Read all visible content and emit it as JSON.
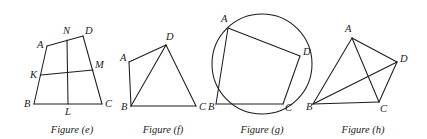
{
  "page": {
    "background_color": "#ffffff",
    "stroke_color": "#1d1d1d",
    "width": 427,
    "height": 139
  },
  "figures": [
    {
      "id": "figure-e",
      "caption": "Figure (e)",
      "caption_x": 72,
      "caption_y": 133,
      "shape": "trapezoid with midsegments",
      "vertices": [
        {
          "name": "A",
          "x": 47,
          "y": 46,
          "label_x": 37,
          "label_y": 48
        },
        {
          "name": "D",
          "x": 83,
          "y": 36,
          "label_x": 85,
          "label_y": 34
        },
        {
          "name": "B",
          "x": 34,
          "y": 104,
          "label_x": 24,
          "label_y": 107
        },
        {
          "name": "C",
          "x": 102,
          "y": 104,
          "label_x": 105,
          "label_y": 107
        },
        {
          "name": "N",
          "x": 67,
          "y": 40,
          "label_x": 63,
          "label_y": 34
        },
        {
          "name": "L",
          "x": 68,
          "y": 104,
          "label_x": 65,
          "label_y": 115
        },
        {
          "name": "K",
          "x": 41,
          "y": 75,
          "label_x": 30,
          "label_y": 78
        },
        {
          "name": "M",
          "x": 93,
          "y": 70,
          "label_x": 95,
          "label_y": 68
        }
      ],
      "segments": [
        {
          "name": "AD",
          "from": "A",
          "to": "D"
        },
        {
          "name": "AB",
          "from": "A",
          "to": "B"
        },
        {
          "name": "BC",
          "from": "B",
          "to": "C"
        },
        {
          "name": "DC",
          "from": "D",
          "to": "C"
        },
        {
          "name": "NL",
          "from": "N",
          "to": "L"
        },
        {
          "name": "KM",
          "from": "K",
          "to": "M"
        }
      ]
    },
    {
      "id": "figure-f",
      "caption": "Figure (f)",
      "caption_x": 163,
      "caption_y": 133,
      "shape": "quadrilateral with one diagonal",
      "vertices": [
        {
          "name": "A",
          "x": 129,
          "y": 62,
          "label_x": 120,
          "label_y": 61
        },
        {
          "name": "D",
          "x": 166,
          "y": 45,
          "label_x": 166,
          "label_y": 40
        },
        {
          "name": "B",
          "x": 131,
          "y": 106,
          "label_x": 121,
          "label_y": 110
        },
        {
          "name": "C",
          "x": 196,
          "y": 106,
          "label_x": 199,
          "label_y": 110
        }
      ],
      "segments": [
        {
          "name": "AD",
          "from": "A",
          "to": "D"
        },
        {
          "name": "AB",
          "from": "A",
          "to": "B"
        },
        {
          "name": "BC",
          "from": "B",
          "to": "C"
        },
        {
          "name": "DC",
          "from": "D",
          "to": "C"
        },
        {
          "name": "BD",
          "from": "B",
          "to": "D"
        }
      ]
    },
    {
      "id": "figure-g",
      "caption": "Figure (g)",
      "caption_x": 262,
      "caption_y": 133,
      "shape": "cyclic quadrilateral inscribed in a circle",
      "circle": {
        "cx": 262,
        "cy": 64,
        "r": 50
      },
      "vertices": [
        {
          "name": "A",
          "x": 228,
          "y": 28,
          "label_x": 221,
          "label_y": 22
        },
        {
          "name": "D",
          "x": 300,
          "y": 56,
          "label_x": 303,
          "label_y": 55
        },
        {
          "name": "B",
          "x": 216,
          "y": 104,
          "label_x": 208,
          "label_y": 110
        },
        {
          "name": "C",
          "x": 283,
          "y": 104,
          "label_x": 285,
          "label_y": 111
        }
      ],
      "segments": [
        {
          "name": "AD",
          "from": "A",
          "to": "D"
        },
        {
          "name": "AB",
          "from": "A",
          "to": "B"
        },
        {
          "name": "BC",
          "from": "B",
          "to": "C"
        },
        {
          "name": "DC",
          "from": "D",
          "to": "C"
        }
      ]
    },
    {
      "id": "figure-h",
      "caption": "Figure (h)",
      "caption_x": 363,
      "caption_y": 133,
      "shape": "quadrilateral with both diagonals",
      "vertices": [
        {
          "name": "A",
          "x": 352,
          "y": 38,
          "label_x": 345,
          "label_y": 32
        },
        {
          "name": "D",
          "x": 397,
          "y": 62,
          "label_x": 400,
          "label_y": 62
        },
        {
          "name": "B",
          "x": 313,
          "y": 104,
          "label_x": 306,
          "label_y": 110
        },
        {
          "name": "C",
          "x": 379,
          "y": 102,
          "label_x": 380,
          "label_y": 112
        }
      ],
      "segments": [
        {
          "name": "AD",
          "from": "A",
          "to": "D"
        },
        {
          "name": "AB",
          "from": "A",
          "to": "B"
        },
        {
          "name": "BC",
          "from": "B",
          "to": "C"
        },
        {
          "name": "DC",
          "from": "D",
          "to": "C"
        },
        {
          "name": "AC",
          "from": "A",
          "to": "C"
        },
        {
          "name": "BD",
          "from": "B",
          "to": "D"
        }
      ]
    }
  ]
}
